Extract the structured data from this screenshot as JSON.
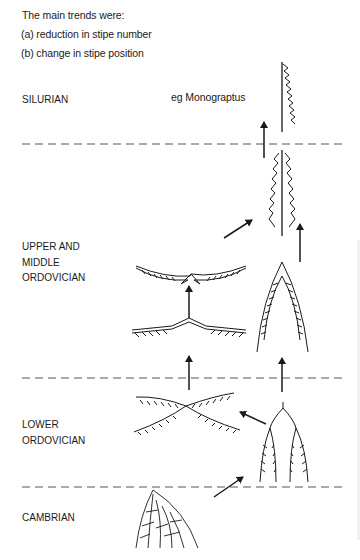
{
  "intro": {
    "heading": "The main trends were:",
    "points": [
      "(a) reduction in stipe number",
      "(b) change in stipe position"
    ]
  },
  "periods": [
    {
      "id": "silurian",
      "lines": [
        "SILURIAN"
      ]
    },
    {
      "id": "upper-middle-ordovician",
      "lines": [
        "UPPER AND",
        "MIDDLE",
        "ORDOVICIAN"
      ]
    },
    {
      "id": "lower-ordovician",
      "lines": [
        "LOWER",
        "ORDOVICIAN"
      ]
    },
    {
      "id": "cambrian",
      "lines": [
        "CAMBRIAN"
      ]
    }
  ],
  "annotations": {
    "example_label": "eg Monograptus"
  },
  "boundaries_y": [
    144,
    378,
    487
  ],
  "colors": {
    "ink": "#1a1a1a",
    "background": "#ffffff"
  }
}
